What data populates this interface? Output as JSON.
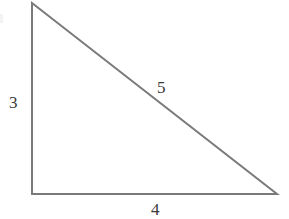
{
  "figure": {
    "background_color": "#ffffff",
    "width": 289,
    "height": 219
  },
  "chart_data": {
    "type": "diagram",
    "shape": "right-triangle",
    "title": "",
    "xlabel": "",
    "ylabel": "",
    "stroke_color": "#7a7a7a",
    "stroke_width": 2,
    "fill": "none",
    "vertices": [
      {
        "name": "apex",
        "x": 32,
        "y": 3
      },
      {
        "name": "bottom-left",
        "x": 32,
        "y": 194
      },
      {
        "name": "bottom-right",
        "x": 277,
        "y": 194
      }
    ],
    "polygon_points": "32,3 32,194 277,194",
    "right_angle_at": "bottom-left",
    "sides": [
      {
        "name": "vertical-leg",
        "label": "3",
        "value": 3,
        "from": "apex",
        "to": "bottom-left"
      },
      {
        "name": "horizontal-leg",
        "label": "4",
        "value": 4,
        "from": "bottom-left",
        "to": "bottom-right"
      },
      {
        "name": "hypotenuse",
        "label": "5",
        "value": 5,
        "from": "apex",
        "to": "bottom-right"
      }
    ],
    "labels": {
      "vertical_leg": "3",
      "hypotenuse": "5",
      "horizontal_leg": "4"
    },
    "label_color": "#3a3a3a"
  }
}
